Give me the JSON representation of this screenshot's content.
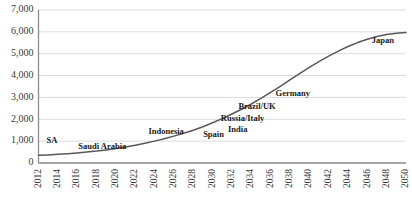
{
  "chart_data": {
    "type": "line",
    "title": "",
    "xlabel": "",
    "ylabel": "",
    "xlim": [
      2012,
      2050
    ],
    "ylim": [
      0,
      7000
    ],
    "grid": true,
    "legend": "none",
    "line_color": "#58585a",
    "gridline_color": "#d2d2d2",
    "axis_color": "#8c8c8c",
    "y_ticks": [
      {
        "value": 7000,
        "label": "7,000"
      },
      {
        "value": 6000,
        "label": "6,000"
      },
      {
        "value": 5000,
        "label": "5,000"
      },
      {
        "value": 4000,
        "label": "4,000"
      },
      {
        "value": 3000,
        "label": "3,000"
      },
      {
        "value": 2000,
        "label": "2,000"
      },
      {
        "value": 1000,
        "label": "1,000"
      },
      {
        "value": 0,
        "label": "0"
      }
    ],
    "x_ticks": [
      {
        "value": 2012,
        "label": "2012"
      },
      {
        "value": 2014,
        "label": "2014"
      },
      {
        "value": 2016,
        "label": "2016"
      },
      {
        "value": 2018,
        "label": "2018"
      },
      {
        "value": 2020,
        "label": "2020"
      },
      {
        "value": 2022,
        "label": "2022"
      },
      {
        "value": 2024,
        "label": "2024"
      },
      {
        "value": 2026,
        "label": "2026"
      },
      {
        "value": 2028,
        "label": "2028"
      },
      {
        "value": 2030,
        "label": "2030"
      },
      {
        "value": 2032,
        "label": "2032"
      },
      {
        "value": 2034,
        "label": "2034"
      },
      {
        "value": 2036,
        "label": "2036"
      },
      {
        "value": 2038,
        "label": "2038"
      },
      {
        "value": 2040,
        "label": "2040"
      },
      {
        "value": 2042,
        "label": "2042"
      },
      {
        "value": 2044,
        "label": "2044"
      },
      {
        "value": 2046,
        "label": "2046"
      },
      {
        "value": 2048,
        "label": "2048"
      },
      {
        "value": 2050,
        "label": "2050"
      }
    ],
    "x": [
      2012,
      2013,
      2014,
      2015,
      2016,
      2017,
      2018,
      2019,
      2020,
      2021,
      2022,
      2023,
      2024,
      2025,
      2026,
      2027,
      2028,
      2029,
      2030,
      2031,
      2032,
      2033,
      2034,
      2035,
      2036,
      2037,
      2038,
      2039,
      2040,
      2041,
      2042,
      2043,
      2044,
      2045,
      2046,
      2047,
      2048,
      2049,
      2050
    ],
    "series": [
      {
        "name": "cumulative",
        "values": [
          350,
          370,
          395,
          425,
          460,
          500,
          545,
          600,
          660,
          730,
          810,
          900,
          1000,
          1110,
          1230,
          1360,
          1500,
          1660,
          1840,
          2030,
          2240,
          2460,
          2700,
          2960,
          3230,
          3510,
          3800,
          4090,
          4370,
          4640,
          4890,
          5120,
          5330,
          5510,
          5660,
          5790,
          5880,
          5940,
          5970
        ]
      }
    ],
    "annotations": [
      {
        "text": "SA",
        "x": 2013.4,
        "y": 900
      },
      {
        "text": "Saudi Arabia",
        "x": 2018.6,
        "y": 620
      },
      {
        "text": "Indonesia",
        "x": 2025.2,
        "y": 1320
      },
      {
        "text": "Spain",
        "x": 2030.1,
        "y": 1180
      },
      {
        "text": "India",
        "x": 2032.6,
        "y": 1430
      },
      {
        "text": "Russia/Italy",
        "x": 2033.1,
        "y": 1940
      },
      {
        "text": "Brazil/UK",
        "x": 2034.6,
        "y": 2450
      },
      {
        "text": "Germany",
        "x": 2038.3,
        "y": 3080
      },
      {
        "text": "Japan",
        "x": 2047.6,
        "y": 5470
      }
    ]
  }
}
